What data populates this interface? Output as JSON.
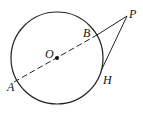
{
  "diagram": {
    "type": "geometry",
    "circle": {
      "cx": 57,
      "cy": 58,
      "r": 46
    },
    "points": {
      "O": {
        "label": "O",
        "x": 57,
        "y": 58
      },
      "A": {
        "label": "A",
        "x": 14,
        "y": 82
      },
      "B": {
        "label": "B",
        "x": 97,
        "y": 35
      },
      "P": {
        "label": "P",
        "x": 127,
        "y": 16
      },
      "H": {
        "label": "H",
        "x": 101,
        "y": 71
      }
    },
    "segments": [
      {
        "from": "A",
        "to": "B",
        "style": "dashed"
      },
      {
        "from": "B",
        "to": "P",
        "style": "solid"
      },
      {
        "from": "P",
        "to": "H",
        "style": "solid"
      }
    ],
    "stroke_color": "#222222"
  }
}
